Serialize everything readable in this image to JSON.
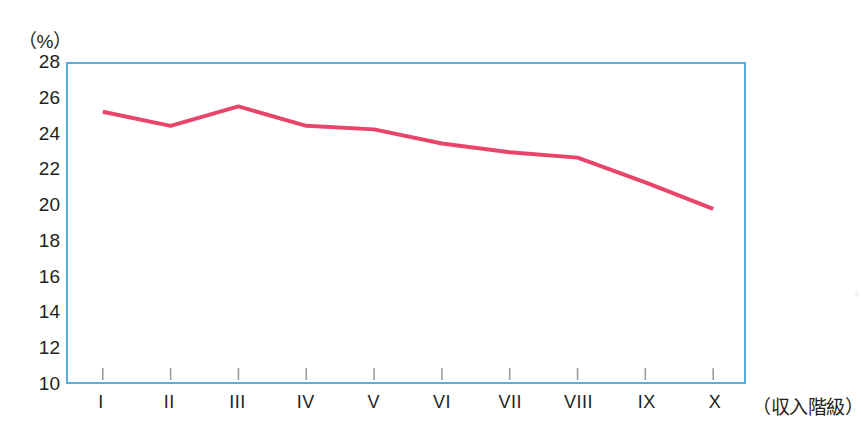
{
  "figure": {
    "unit_label": "（%）",
    "axis_colors": {
      "plot_border": "#56aee0",
      "line": "#e8456a",
      "tick_mark": "#9a9a9a",
      "text": "#231f20"
    }
  },
  "chart_data": {
    "type": "line",
    "title": "",
    "subtitle": "",
    "xlabel": "（収入階級）",
    "ylabel": "（%）",
    "categories": [
      "I",
      "II",
      "III",
      "IV",
      "V",
      "VI",
      "VII",
      "VIII",
      "IX",
      "X"
    ],
    "values": [
      25.3,
      24.5,
      25.6,
      24.5,
      24.3,
      23.5,
      23.0,
      22.7,
      21.3,
      19.8
    ],
    "series": [
      {
        "name": "",
        "color": "#e8456a",
        "values": [
          25.3,
          24.5,
          25.6,
          24.5,
          24.3,
          23.5,
          23.0,
          22.7,
          21.3,
          19.8
        ]
      }
    ],
    "ylim": [
      10,
      28
    ],
    "yticks": [
      28,
      26,
      24,
      22,
      20,
      18,
      16,
      14,
      12,
      10
    ],
    "ytick_labels": [
      "28",
      "26",
      "24",
      "22",
      "20",
      "18",
      "16",
      "14",
      "12",
      "10"
    ],
    "xtick_labels": [
      "I",
      "II",
      "III",
      "IV",
      "V",
      "VI",
      "VII",
      "VIII",
      "IX",
      "X"
    ],
    "grid": false,
    "legend": "none",
    "markers": false,
    "line_width_px": 4
  }
}
